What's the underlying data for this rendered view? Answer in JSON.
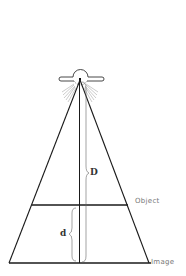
{
  "diagram": {
    "labels": {
      "object": "Object",
      "image": "Image",
      "source_distance": "D",
      "object_distance": "d"
    },
    "elements": {
      "source": "x-ray tube (bulb with radiating rays)",
      "beam": "triangular beam diverging from focal spot",
      "central_ray": "vertical line from focal spot to image plane",
      "object_plane": "horizontal line across beam",
      "image_plane": "horizontal line at base of beam"
    },
    "colors": {
      "line": "#1a1a1a",
      "brace": "#666666",
      "label": "#777777"
    }
  }
}
